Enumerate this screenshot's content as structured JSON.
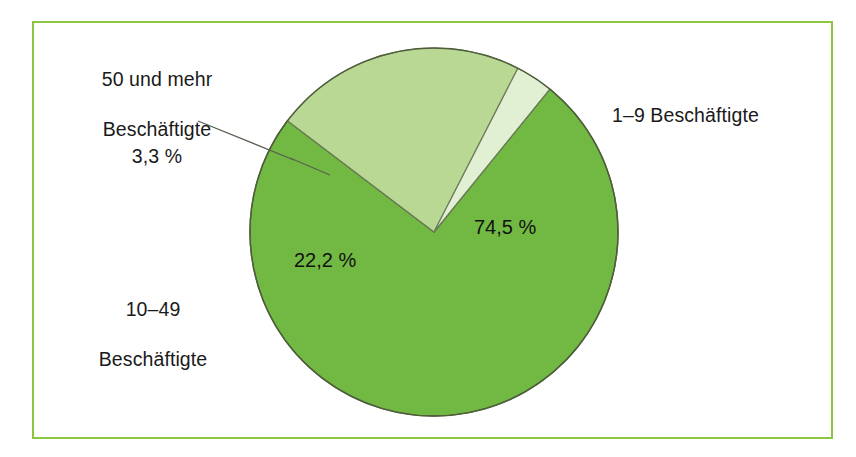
{
  "figure": {
    "frame_color": "#8cc63e",
    "background": "#ffffff"
  },
  "chart_data": {
    "type": "pie",
    "title": "",
    "subtitle": "",
    "xlabel": "",
    "ylabel": "",
    "unit": "%",
    "decimal_separator": ",",
    "legend_position": "callout-labels",
    "grid": false,
    "categories": [
      "1–9 Beschäftigte",
      "10–49 Beschäftigte",
      "50 und mehr Beschäftigte"
    ],
    "values": [
      74.5,
      22.2,
      3.3
    ],
    "value_labels": [
      "74,5 %",
      "22,2 %",
      "3,3 %"
    ],
    "colors": [
      "#72b943",
      "#b9d894",
      "#e1f0d2"
    ],
    "slices": [
      {
        "label": "1–9 Beschäftigte",
        "value": 74.5,
        "value_label": "74,5 %",
        "color": "#72b943",
        "label_position": "right-outside"
      },
      {
        "label": "10–49 Beschäftigte",
        "value": 22.2,
        "value_label": "22,2 %",
        "color": "#b9d894",
        "label_position": "left-outside"
      },
      {
        "label": "50 und mehr Beschäftigte",
        "value": 3.3,
        "value_label": "3,3 %",
        "color": "#e1f0d2",
        "label_position": "upper-left-outside-with-leader"
      }
    ]
  },
  "labels": {
    "fifty_plus_line1": "50 und mehr",
    "fifty_plus_line2": "Beschäftigte",
    "fifty_plus_value": "3,3 %",
    "one_to_nine": "1–9 Beschäftigte",
    "ten_to_fortynine_line1": "10–49",
    "ten_to_fortynine_line2": "Beschäftigte",
    "value_74": "74,5 %",
    "value_22": "22,2 %"
  }
}
